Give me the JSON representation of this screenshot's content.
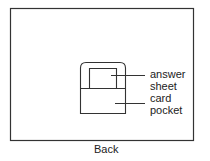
{
  "diagram": {
    "view_label": "Back",
    "labels": {
      "answer_sheet_line1": "answer",
      "answer_sheet_line2": "sheet",
      "card_pocket_line1": "card",
      "card_pocket_line2": "pocket"
    }
  }
}
